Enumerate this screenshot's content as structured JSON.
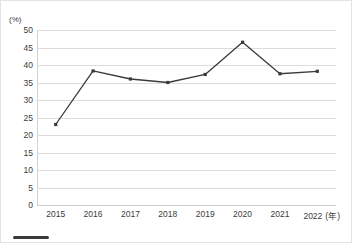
{
  "chart_data": {
    "type": "line",
    "title": "",
    "xlabel": "",
    "ylabel": "",
    "unit_label": "(%)",
    "x_unit_label": "(年)",
    "categories": [
      "2015",
      "2016",
      "2017",
      "2018",
      "2019",
      "2020",
      "2021",
      "2022"
    ],
    "values": [
      23.0,
      38.3,
      36.0,
      35.0,
      37.3,
      46.5,
      37.5,
      38.2
    ],
    "series": [
      {
        "name": "",
        "values": [
          23.0,
          38.3,
          36.0,
          35.0,
          37.3,
          46.5,
          37.5,
          38.2
        ],
        "color": "#3a3a3a",
        "marker": "square"
      }
    ],
    "ylim": [
      0,
      50
    ],
    "y_ticks": [
      50,
      45,
      40,
      35,
      30,
      25,
      20,
      15,
      10,
      5,
      0
    ],
    "y_tick_labels": [
      "50",
      "45",
      "40",
      "35",
      "30",
      "25",
      "20",
      "15",
      "10",
      "5",
      "0"
    ],
    "grid": true,
    "grid_axis": "y",
    "legend": false,
    "legend_position": "bottom-left",
    "colors": {
      "line": "#3a3a3a",
      "marker": "#3a3a3a",
      "gridline": "#dcdcdc",
      "axis": "#d2d2d2",
      "text": "#3b3b3b",
      "background": "#ffffff",
      "border": "#e3e3e3"
    }
  }
}
